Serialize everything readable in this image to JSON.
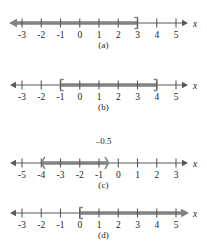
{
  "figure": {
    "title": "",
    "axis_variable": "x",
    "line_color": "#58595b",
    "shade_color": "#808285",
    "text_color": "#231f20"
  },
  "panels": [
    {
      "id": "a",
      "caption": "(a)",
      "axis_label": "x",
      "ticks": [
        "-3",
        "-2",
        "-1",
        "0",
        "1",
        "2",
        "3",
        "4",
        "5"
      ],
      "tick_values": [
        -3,
        -2,
        -1,
        0,
        1,
        2,
        3,
        4,
        5
      ],
      "axis_min": -3,
      "axis_max": 5,
      "left_arrow": true,
      "right_arrow": true,
      "top_label": "",
      "interval": {
        "start": "-infinity",
        "end": "3",
        "start_type": "arrow",
        "end_type": "bracket",
        "start_inclusive": false,
        "end_inclusive": true,
        "notation": "x <= 3"
      }
    },
    {
      "id": "b",
      "caption": "(b)",
      "axis_label": "x",
      "ticks": [
        "-3",
        "-2",
        "-1",
        "0",
        "1",
        "2",
        "3",
        "4",
        "5"
      ],
      "tick_values": [
        -3,
        -2,
        -1,
        0,
        1,
        2,
        3,
        4,
        5
      ],
      "axis_min": -3,
      "axis_max": 5,
      "left_arrow": true,
      "right_arrow": true,
      "top_label": "",
      "interval": {
        "start": "-1",
        "end": "4",
        "start_type": "bracket",
        "end_type": "bracket",
        "start_inclusive": true,
        "end_inclusive": true,
        "notation": "-1 <= x <= 4"
      }
    },
    {
      "id": "c",
      "caption": "(c)",
      "axis_label": "x",
      "ticks": [
        "-5",
        "-4",
        "-3",
        "-2",
        "-1",
        "0",
        "1",
        "2",
        "3"
      ],
      "tick_values": [
        -5,
        -4,
        -3,
        -2,
        -1,
        0,
        1,
        2,
        3
      ],
      "axis_min": -5,
      "axis_max": 3,
      "left_arrow": true,
      "right_arrow": true,
      "top_label": "–0.5",
      "top_label_value": -0.5,
      "interval": {
        "start": "-4",
        "end": "-0.5",
        "start_type": "parenthesis",
        "end_type": "parenthesis",
        "start_inclusive": false,
        "end_inclusive": false,
        "notation": "-4 < x < -0.5"
      }
    },
    {
      "id": "d",
      "caption": "(d)",
      "axis_label": "x",
      "ticks": [
        "-3",
        "-2",
        "-1",
        "0",
        "1",
        "2",
        "3",
        "4",
        "5"
      ],
      "tick_values": [
        -3,
        -2,
        -1,
        0,
        1,
        2,
        3,
        4,
        5
      ],
      "axis_min": -3,
      "axis_max": 5,
      "left_arrow": true,
      "right_arrow": true,
      "top_label": "",
      "interval": {
        "start": "0",
        "end": "+infinity",
        "start_type": "bracket",
        "end_type": "arrow",
        "start_inclusive": true,
        "end_inclusive": false,
        "notation": "x >= 0"
      }
    }
  ]
}
